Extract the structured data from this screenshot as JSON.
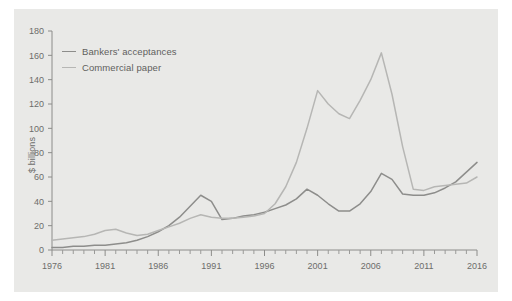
{
  "chart_data": {
    "type": "line",
    "title": "",
    "xlabel": "",
    "ylabel": "$ billions",
    "xlim": [
      1976,
      2016
    ],
    "ylim": [
      0,
      180
    ],
    "yticks": [
      0,
      20,
      40,
      60,
      80,
      100,
      120,
      140,
      160,
      180
    ],
    "xticks": [
      1976,
      1981,
      1986,
      1991,
      1996,
      2001,
      2006,
      2011,
      2016
    ],
    "xtick_minor_step": 1,
    "grid": false,
    "legend_position": "top-left",
    "x": [
      1976,
      1977,
      1978,
      1979,
      1980,
      1981,
      1982,
      1983,
      1984,
      1985,
      1986,
      1987,
      1988,
      1989,
      1990,
      1991,
      1992,
      1993,
      1994,
      1995,
      1996,
      1997,
      1998,
      1999,
      2000,
      2001,
      2002,
      2003,
      2004,
      2005,
      2006,
      2007,
      2008,
      2009,
      2010,
      2011,
      2012,
      2013,
      2014,
      2015,
      2016
    ],
    "series": [
      {
        "name": "Bankers' acceptances",
        "color": "#8d8d8b",
        "values": [
          2,
          2,
          3,
          3,
          4,
          4,
          5,
          6,
          8,
          11,
          15,
          20,
          27,
          36,
          45,
          40,
          25,
          26,
          28,
          29,
          31,
          34,
          37,
          42,
          50,
          45,
          38,
          32,
          32,
          38,
          48,
          63,
          58,
          46,
          45,
          45,
          47,
          51,
          56,
          64,
          72
        ]
      },
      {
        "name": "Commercial paper",
        "color": "#b6b6b4",
        "values": [
          8,
          9,
          10,
          11,
          13,
          16,
          17,
          14,
          12,
          13,
          16,
          19,
          22,
          26,
          29,
          27,
          26,
          26,
          27,
          28,
          30,
          38,
          52,
          72,
          100,
          131,
          120,
          112,
          108,
          123,
          140,
          162,
          128,
          85,
          50,
          49,
          52,
          53,
          54,
          55,
          60
        ]
      }
    ]
  },
  "legend": {
    "items": [
      {
        "label": "Bankers' acceptances",
        "color": "#8d8d8b"
      },
      {
        "label": "Commercial paper",
        "color": "#b6b6b4"
      }
    ]
  },
  "axis": {
    "y_axis_title": "$ billions",
    "y_tick_labels": [
      "180",
      "160",
      "140",
      "120",
      "100",
      "80",
      "60",
      "40",
      "20",
      "0"
    ],
    "x_tick_labels": [
      "1976",
      "1981",
      "1986",
      "1991",
      "1996",
      "2001",
      "2006",
      "2011",
      "2016"
    ]
  },
  "colors": {
    "panel_background": "#e9e9e7",
    "page_background": "#ffffff",
    "axis": "#8c8c8a",
    "text": "#6d6d6b",
    "series_dark": "#8d8d8b",
    "series_light": "#b6b6b4"
  }
}
